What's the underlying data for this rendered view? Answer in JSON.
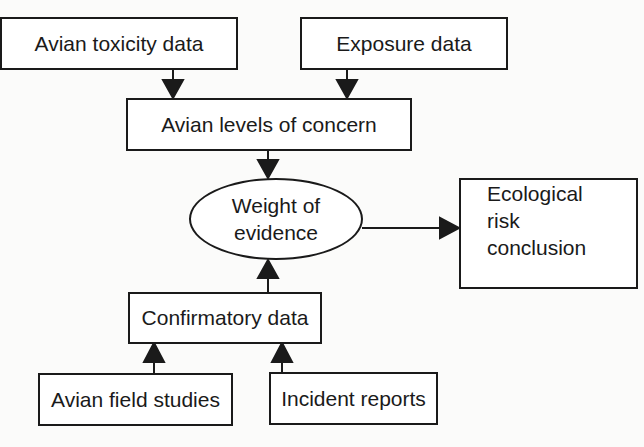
{
  "diagram": {
    "nodes": {
      "avian_toxicity": "Avian toxicity data",
      "exposure": "Exposure data",
      "levels_of_concern": "Avian levels of concern",
      "weight_of_evidence": {
        "line1": "Weight of",
        "line2": "evidence"
      },
      "ecological_risk": {
        "line1": "Ecological",
        "line2": "risk",
        "line3": "conclusion"
      },
      "confirmatory": "Confirmatory data",
      "field_studies": "Avian field studies",
      "incident_reports": "Incident reports"
    },
    "edges": [
      {
        "from": "Avian toxicity data",
        "to": "Avian levels of concern"
      },
      {
        "from": "Exposure data",
        "to": "Avian levels of concern"
      },
      {
        "from": "Avian levels of concern",
        "to": "Weight of evidence"
      },
      {
        "from": "Confirmatory data",
        "to": "Weight of evidence"
      },
      {
        "from": "Weight of evidence",
        "to": "Ecological risk conclusion"
      },
      {
        "from": "Avian field studies",
        "to": "Confirmatory data"
      },
      {
        "from": "Incident reports",
        "to": "Confirmatory data"
      }
    ]
  }
}
